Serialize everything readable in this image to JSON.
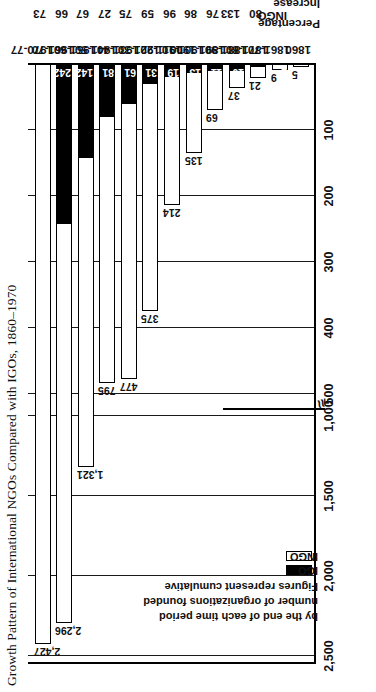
{
  "figure": {
    "title": "Growth Pattern of International NGOs Compared with IGOs, 1860–1970"
  },
  "legend": {
    "ingo_label": "INGO",
    "igo_label": "IGO",
    "note_line1": "Figures represent cumulative",
    "note_line2": "number of organizations founded",
    "note_line3": "by the end of each time period",
    "ingo_color": "#ffffff",
    "igo_color": "#000000"
  },
  "percentage_table": {
    "header_line1": "Percentage",
    "header_line2": "Increase",
    "row_labels": [
      "INGO",
      "IGO"
    ]
  },
  "axis": {
    "tick_labels": [
      "2,500",
      "2,000",
      "1,500",
      "1,000",
      "500",
      "400",
      "300",
      "200",
      "100"
    ],
    "break_glyph": "≈"
  },
  "chart_data": {
    "type": "bar",
    "title": "Growth Pattern of International NGOs Compared with IGOs, 1860–1970",
    "orientation": "horizontal",
    "xlabel": "",
    "ylabel": "",
    "grid": true,
    "legend_position": "inside-left",
    "axis_note": "Value axis is broken: 0–500 expanded (ticks 100,200,300,400,500), then 1,000–2,500 compressed (ticks 1,000; 1,500; 2,000; 2,500)",
    "axis_tick_values": [
      2500,
      2000,
      1500,
      1000,
      500,
      400,
      300,
      200,
      100
    ],
    "categories": [
      "1860",
      "1861-70",
      "1871-80",
      "1881-90",
      "1891-1900",
      "1901-10",
      "1911-20",
      "1921-30",
      "1931-40",
      "1941-50",
      "1951-60",
      "1961-70",
      "1970-77"
    ],
    "series": [
      {
        "name": "INGO",
        "values": [
          5,
          9,
          21,
          37,
          69,
          135,
          214,
          375,
          477,
          795,
          1321,
          2296,
          2427
        ],
        "labels": [
          "5",
          "9",
          "21",
          "37",
          "69",
          "135",
          "214",
          "375",
          "477",
          "795",
          "1,321",
          "2,296",
          "2,427"
        ]
      },
      {
        "name": "IGO",
        "values": [
          1,
          2,
          5,
          10,
          11,
          13,
          19,
          31,
          61,
          81,
          142,
          242,
          null
        ],
        "labels": [
          "1",
          "2",
          "5",
          "10",
          "11",
          "13",
          "19",
          "31",
          "61",
          "81",
          "142",
          "242",
          ""
        ]
      }
    ],
    "percentage_increase": {
      "categories": [
        "1861-70",
        "1871-80",
        "1881-90",
        "1891-1900",
        "1901-10",
        "1911-20",
        "1921-30",
        "1931-40",
        "1941-50",
        "1951-60",
        "1961-70"
      ],
      "INGO": [
        80,
        133,
        76,
        86,
        96,
        59,
        75,
        27,
        67,
        66,
        73
      ],
      "IGO": [
        100,
        150,
        100,
        10,
        18,
        46,
        63,
        97,
        33,
        75,
        70
      ]
    }
  }
}
